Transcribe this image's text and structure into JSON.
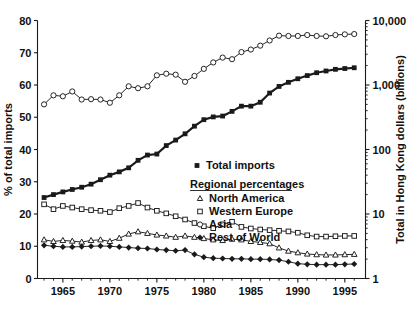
{
  "chart_data": {
    "type": "line",
    "title": "",
    "subtitle": "",
    "xlabel": "",
    "ylabel": "% of total imports",
    "y2label": "Total in Hong Kong dollars (billions)",
    "xlim": [
      1962.3,
      1997.2
    ],
    "ylim": [
      0,
      80
    ],
    "y2lim": [
      1,
      10000
    ],
    "y2_scale": "log",
    "grid": false,
    "legend_position": "center-right-inside",
    "yticks": [
      0,
      10,
      20,
      30,
      40,
      50,
      60,
      70,
      80
    ],
    "ytick_labels": [
      "0",
      "10",
      "20",
      "30",
      "40",
      "50",
      "60",
      "70",
      "80"
    ],
    "y2ticks": [
      1,
      10,
      100,
      1000,
      10000
    ],
    "y2tick_labels": [
      "1",
      "10",
      "100",
      "1,000",
      "10,000"
    ],
    "xticks": [
      1965,
      1970,
      1975,
      1980,
      1985,
      1990,
      1995
    ],
    "xtick_labels": [
      "1965",
      "1970",
      "1975",
      "1980",
      "1985",
      "1990",
      "1995"
    ],
    "x": [
      1963,
      1964,
      1965,
      1966,
      1967,
      1968,
      1969,
      1970,
      1971,
      1972,
      1973,
      1974,
      1975,
      1976,
      1977,
      1978,
      1979,
      1980,
      1981,
      1982,
      1983,
      1984,
      1985,
      1986,
      1987,
      1988,
      1989,
      1990,
      1991,
      1992,
      1993,
      1994,
      1995,
      1996
    ],
    "series": [
      {
        "name": "Total imports",
        "marker": "filled-square",
        "axis": "right",
        "values": [
          18,
          20,
          22,
          24,
          26,
          29,
          34,
          40,
          45,
          52,
          68,
          82,
          85,
          115,
          140,
          175,
          230,
          290,
          320,
          330,
          390,
          470,
          470,
          540,
          750,
          950,
          1100,
          1250,
          1400,
          1550,
          1650,
          1750,
          1800,
          1850
        ]
      },
      {
        "name": "North America",
        "marker": "open-triangle",
        "axis": "left",
        "values": [
          12.0,
          11.5,
          11.8,
          11.6,
          11.3,
          11.8,
          12.0,
          11.5,
          12.5,
          13.8,
          14.5,
          14.0,
          13.5,
          13.2,
          12.8,
          13.2,
          12.8,
          12.4,
          12.0,
          11.8,
          12.2,
          12.0,
          11.5,
          11.2,
          10.8,
          9.5,
          8.5,
          8.0,
          7.6,
          7.4,
          7.3,
          7.3,
          7.4,
          7.5
        ]
      },
      {
        "name": "Western Europe",
        "marker": "open-square",
        "axis": "left",
        "values": [
          23.0,
          21.5,
          22.5,
          22.0,
          21.5,
          21.2,
          21.0,
          20.6,
          21.8,
          22.5,
          23.4,
          22.0,
          21.0,
          20.2,
          19.3,
          18.3,
          17.2,
          16.2,
          15.6,
          16.8,
          17.6,
          16.0,
          15.5,
          15.2,
          15.0,
          14.8,
          14.6,
          14.2,
          13.4,
          13.0,
          13.0,
          13.1,
          13.2,
          13.2
        ]
      },
      {
        "name": "Asia",
        "marker": "open-circle",
        "axis": "left",
        "values": [
          54.0,
          56.8,
          56.5,
          58.0,
          55.5,
          55.6,
          55.5,
          54.5,
          56.8,
          59.6,
          59.0,
          59.6,
          63.0,
          63.5,
          63.2,
          61.0,
          62.8,
          65.0,
          67.0,
          68.5,
          68.0,
          70.2,
          71.0,
          72.2,
          73.8,
          75.3,
          75.2,
          75.2,
          75.5,
          75.2,
          75.1,
          75.5,
          75.7,
          75.8
        ]
      },
      {
        "name": "Rest of World",
        "marker": "filled-diamond",
        "axis": "left",
        "values": [
          10.3,
          10.0,
          9.8,
          9.8,
          9.9,
          10.0,
          10.1,
          10.0,
          9.8,
          9.6,
          9.4,
          9.3,
          9.0,
          8.8,
          8.6,
          8.8,
          7.5,
          6.6,
          6.3,
          6.2,
          6.1,
          6.1,
          6.0,
          6.0,
          5.9,
          5.7,
          5.2,
          4.6,
          4.4,
          4.3,
          4.3,
          4.3,
          4.4,
          4.5
        ]
      }
    ],
    "legend": {
      "primary_label": "Total imports",
      "group_header": "Regional percentages",
      "items": [
        "North America",
        "Western Europe",
        "Asia",
        "Rest of World"
      ]
    },
    "colors": {
      "line": "#1a1a1a",
      "marker_fill_open": "#ffffff",
      "marker_fill_solid": "#1a1a1a",
      "background": "#ffffff",
      "text": "#111111"
    }
  }
}
